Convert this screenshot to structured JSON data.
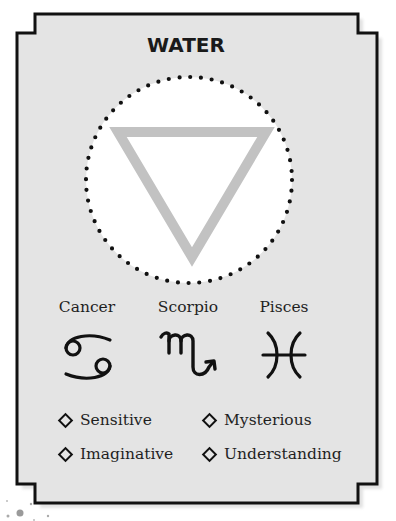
{
  "card": {
    "title": "WATER",
    "background": "#e4e4e4",
    "border_color": "#111111",
    "symbol": "water-triangle",
    "symbol_color": "#c2c2c2"
  },
  "signs": [
    {
      "name": "Cancer",
      "glyph": "cancer-glyph"
    },
    {
      "name": "Scorpio",
      "glyph": "scorpio-glyph"
    },
    {
      "name": "Pisces",
      "glyph": "pisces-glyph"
    }
  ],
  "traits": [
    {
      "label": "Sensitive"
    },
    {
      "label": "Mysterious"
    },
    {
      "label": "Imaginative"
    },
    {
      "label": "Understanding"
    }
  ]
}
